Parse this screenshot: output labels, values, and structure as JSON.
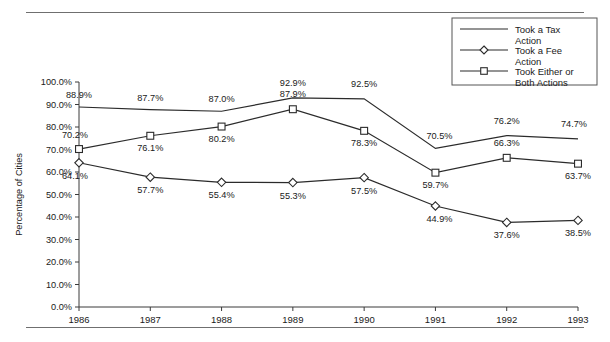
{
  "chart_data": {
    "type": "line",
    "title": "",
    "xlabel": "",
    "ylabel": "Percentage of Cities",
    "categories": [
      "1986",
      "1987",
      "1988",
      "1989",
      "1990",
      "1991",
      "1992",
      "1993"
    ],
    "ylim": [
      0,
      100
    ],
    "ytick_labels": [
      "0.0%",
      "10.0%",
      "20.0%",
      "30.0%",
      "40.0%",
      "50.0%",
      "60.0%",
      "70.0%",
      "80.0%",
      "90.0%",
      "100.0%"
    ],
    "ytick_values": [
      0,
      10,
      20,
      30,
      40,
      50,
      60,
      70,
      80,
      90,
      100
    ],
    "grid": false,
    "legend_position": "top-right",
    "series": [
      {
        "name": "Took a Tax Action",
        "marker": "none",
        "values": [
          88.9,
          87.7,
          87.0,
          92.9,
          92.5,
          70.5,
          76.2,
          74.7
        ],
        "labels": [
          "88.9%",
          "87.7%",
          "87.0%",
          "92.9%",
          "92.5%",
          "70.5%",
          "76.2%",
          "74.7%"
        ]
      },
      {
        "name": "Took a Fee Action",
        "marker": "diamond",
        "values": [
          64.1,
          57.7,
          55.4,
          55.3,
          57.5,
          44.9,
          37.6,
          38.5
        ],
        "labels": [
          "64.1%",
          "57.7%",
          "55.4%",
          "55.3%",
          "57.5%",
          "44.9%",
          "37.6%",
          "38.5%"
        ]
      },
      {
        "name": "Took Either or Both Actions",
        "marker": "square",
        "values": [
          70.2,
          76.1,
          80.2,
          87.9,
          78.3,
          59.7,
          66.3,
          63.7
        ],
        "labels": [
          "70.2%",
          "76.1%",
          "80.2%",
          "87.9%",
          "78.3%",
          "59.7%",
          "66.3%",
          "63.7%"
        ]
      }
    ]
  },
  "legend": {
    "entries": [
      {
        "line1": "Took a Tax",
        "line2": "Action",
        "marker": "none"
      },
      {
        "line1": "Took a Fee",
        "line2": "Action",
        "marker": "diamond"
      },
      {
        "line1": "Took Either or",
        "line2": "Both Actions",
        "marker": "square"
      }
    ]
  },
  "colors": {
    "line": "#2b2b2b",
    "axis": "#3a3a3a",
    "rule": "#6f6f6f",
    "marker_fill": "#ffffff",
    "background": "#ffffff"
  }
}
